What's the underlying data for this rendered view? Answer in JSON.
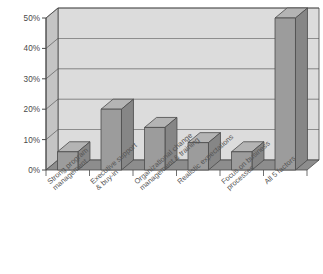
{
  "chart": {
    "title": "",
    "axis": {
      "y_ticks": [
        "0%",
        "10%",
        "20%",
        "30%",
        "40%",
        "50%"
      ],
      "y_min_label": "0%",
      "y_max_label": "50%"
    },
    "colors": {
      "plot_area": "#dcdcdc",
      "bar_face": "#9c9c9c",
      "bar_top": "#b4b4b4",
      "bar_side": "#868686",
      "floor": "#8d8d8d",
      "wall_side": "#c4c4c4",
      "gridline": "#ffffff",
      "outline": "#4a4a4a",
      "label_text": "#555555"
    }
  },
  "chart_data": {
    "type": "bar",
    "title": "",
    "subtitle": "",
    "xlabel": "",
    "ylabel": "",
    "ylim": [
      0,
      50
    ],
    "ytick_values": [
      0,
      10,
      20,
      30,
      40,
      50
    ],
    "ytick_labels": [
      "0%",
      "10%",
      "20%",
      "30%",
      "40%",
      "50%"
    ],
    "grid": true,
    "legend": false,
    "three_d": true,
    "categories": [
      "Strong program management",
      "Executive support & buy-in",
      "Organizational change management & training",
      "Realistic expectations",
      "Focus on business processes",
      "All 5 factors"
    ],
    "category_lines": [
      [
        "Strong program",
        "management"
      ],
      [
        "Executive support",
        "& buy-in"
      ],
      [
        "Organizational change",
        "management & training"
      ],
      [
        "Realistic expectations"
      ],
      [
        "Focus on business",
        "processes"
      ],
      [
        "All 5 factors"
      ]
    ],
    "values": [
      6,
      20,
      14,
      9,
      6,
      50
    ],
    "value_unit": "%"
  }
}
